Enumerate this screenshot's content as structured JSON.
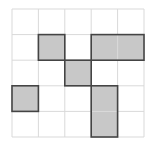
{
  "grid": {
    "rows": 5,
    "cols": 5,
    "origin_x": 12,
    "origin_y": 9,
    "cell_w": 26.4,
    "cell_h": 25.6,
    "grid_line_color": "#d9d9d9",
    "fill_color": "#c8c8c8",
    "border_color": "#444444"
  },
  "shaded_cells": [
    {
      "row": 1,
      "col": 1
    },
    {
      "row": 1,
      "col": 3
    },
    {
      "row": 1,
      "col": 4
    },
    {
      "row": 2,
      "col": 2
    },
    {
      "row": 3,
      "col": 0
    },
    {
      "row": 3,
      "col": 3
    },
    {
      "row": 4,
      "col": 3
    }
  ],
  "outlined_shapes": [
    {
      "row": 1,
      "col": 1,
      "w": 1,
      "h": 1
    },
    {
      "row": 1,
      "col": 3,
      "w": 2,
      "h": 1
    },
    {
      "row": 2,
      "col": 2,
      "w": 1,
      "h": 1
    },
    {
      "row": 3,
      "col": 0,
      "w": 1,
      "h": 1
    },
    {
      "row": 3,
      "col": 3,
      "w": 1,
      "h": 2
    }
  ]
}
